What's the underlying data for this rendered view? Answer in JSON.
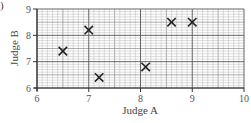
{
  "part_marker": ")",
  "chart_data": {
    "type": "scatter",
    "title": "",
    "xlabel": "Judge A",
    "ylabel": "Judge B",
    "xlim": [
      6,
      10
    ],
    "ylim": [
      6,
      9
    ],
    "xticks": [
      6,
      7,
      8,
      9,
      10
    ],
    "yticks": [
      6,
      7,
      8,
      9
    ],
    "grid": true,
    "grid_minor_step": 0.1,
    "marker": "x",
    "points": [
      {
        "x": 6.5,
        "y": 7.4
      },
      {
        "x": 7.0,
        "y": 8.2
      },
      {
        "x": 7.2,
        "y": 6.4
      },
      {
        "x": 8.1,
        "y": 6.8
      },
      {
        "x": 8.6,
        "y": 8.5
      },
      {
        "x": 9.0,
        "y": 8.5
      }
    ],
    "legend": null
  },
  "colors": {
    "minor_grid": "#b8b8b8",
    "major_grid": "#555555",
    "axis": "#333333",
    "marker": "#222222"
  }
}
